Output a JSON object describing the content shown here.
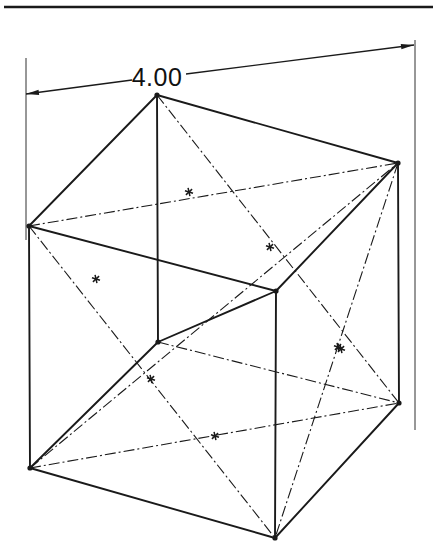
{
  "drawing": {
    "title": "isometric-cube-pictorial",
    "sheet": {
      "width": 437,
      "height": 560,
      "background": "#ffffff"
    },
    "header_rule": {
      "label": "top-border-rule",
      "y": 7,
      "x1": 4,
      "x2": 433,
      "color": "#1a1a1a"
    },
    "dimension": {
      "value": "4.00",
      "text_x": 157,
      "text_y": 86,
      "leader_left": {
        "x1": 26,
        "y1": 94,
        "x2": 132,
        "y2": 80
      },
      "leader_right": {
        "x1": 186,
        "y1": 74,
        "x2": 414,
        "y2": 45
      },
      "extension_left": {
        "x": 26,
        "y1": 58,
        "y2": 240
      },
      "extension_right": {
        "x": 415,
        "y1": 40,
        "y2": 430
      },
      "arrow_left": {
        "x": 26,
        "y": 94
      },
      "arrow_right": {
        "x": 414,
        "y": 45
      },
      "color": "#1a1a1a"
    },
    "vertices": {
      "top": {
        "name": "vertex-top",
        "x": 157,
        "y": 95
      },
      "left_upper": {
        "name": "vertex-left-upper",
        "x": 29,
        "y": 226
      },
      "right_upper": {
        "name": "vertex-right-upper",
        "x": 398,
        "y": 163
      },
      "center_front": {
        "name": "vertex-center-front",
        "x": 276,
        "y": 291
      },
      "mid_front_low": {
        "name": "vertex-mid-front-low",
        "x": 158,
        "y": 342
      },
      "left_lower": {
        "name": "vertex-left-lower",
        "x": 30,
        "y": 468
      },
      "right_lower": {
        "name": "vertex-right-lower",
        "x": 399,
        "y": 403
      },
      "bottom": {
        "name": "vertex-bottom",
        "x": 275,
        "y": 538
      }
    },
    "solid_edges": [
      {
        "name": "edge-top-to-left-upper",
        "x1": 157,
        "y1": 95,
        "x2": 29,
        "y2": 226
      },
      {
        "name": "edge-top-to-right-upper",
        "x1": 157,
        "y1": 95,
        "x2": 398,
        "y2": 163
      },
      {
        "name": "edge-top-to-mid-front-low",
        "x1": 157,
        "y1": 95,
        "x2": 158,
        "y2": 342
      },
      {
        "name": "edge-left-upper-to-center-front",
        "x1": 29,
        "y1": 226,
        "x2": 276,
        "y2": 291
      },
      {
        "name": "edge-right-upper-to-center-front",
        "x1": 398,
        "y1": 163,
        "x2": 276,
        "y2": 291
      },
      {
        "name": "edge-left-upper-to-left-lower",
        "x1": 29,
        "y1": 226,
        "x2": 30,
        "y2": 468
      },
      {
        "name": "edge-right-upper-to-right-lower",
        "x1": 398,
        "y1": 163,
        "x2": 399,
        "y2": 403
      },
      {
        "name": "edge-center-front-to-mid-front-low",
        "x1": 276,
        "y1": 291,
        "x2": 158,
        "y2": 342
      },
      {
        "name": "edge-center-front-to-bottom",
        "x1": 276,
        "y1": 291,
        "x2": 275,
        "y2": 538
      },
      {
        "name": "edge-mid-front-low-to-left-lower",
        "x1": 158,
        "y1": 342,
        "x2": 30,
        "y2": 468
      },
      {
        "name": "edge-left-lower-to-bottom",
        "x1": 30,
        "y1": 468,
        "x2": 275,
        "y2": 538
      },
      {
        "name": "edge-right-lower-to-bottom",
        "x1": 399,
        "y1": 403,
        "x2": 275,
        "y2": 538
      }
    ],
    "centerlines": [
      {
        "name": "diagonal-top-to-right-lower",
        "x1": 157,
        "y1": 95,
        "x2": 399,
        "y2": 403
      },
      {
        "name": "diagonal-left-upper-to-right-upper",
        "x1": 29,
        "y1": 226,
        "x2": 398,
        "y2": 163
      },
      {
        "name": "diagonal-left-upper-to-bottom",
        "x1": 29,
        "y1": 226,
        "x2": 275,
        "y2": 538
      },
      {
        "name": "diagonal-left-lower-to-right-upper",
        "x1": 30,
        "y1": 468,
        "x2": 398,
        "y2": 163
      },
      {
        "name": "diagonal-left-lower-to-right-lower",
        "x1": 30,
        "y1": 468,
        "x2": 399,
        "y2": 403
      },
      {
        "name": "diagonal-right-upper-to-bottom",
        "x1": 398,
        "y1": 163,
        "x2": 275,
        "y2": 538
      },
      {
        "name": "diagonal-mid-front-low-to-right-lower",
        "x1": 158,
        "y1": 342,
        "x2": 399,
        "y2": 403
      }
    ],
    "center_markers": [
      {
        "name": "center-marker-upper-face",
        "x": 270,
        "y": 247
      },
      {
        "name": "center-marker-upper-left",
        "x": 189,
        "y": 192
      },
      {
        "name": "center-marker-left-mid",
        "x": 96,
        "y": 279
      },
      {
        "name": "center-marker-right-mid",
        "x": 341,
        "y": 349
      },
      {
        "name": "center-marker-lower-left",
        "x": 151,
        "y": 379
      },
      {
        "name": "center-marker-lower-mid",
        "x": 215,
        "y": 436
      },
      {
        "name": "center-marker-lower-right",
        "x": 338,
        "y": 347
      }
    ],
    "style": {
      "line_color": "#1a1a1a",
      "solid_width": 1.9,
      "center_width": 1.1,
      "center_dash": "11 3 2 3",
      "vertex_dot_radius": 2.6
    }
  }
}
